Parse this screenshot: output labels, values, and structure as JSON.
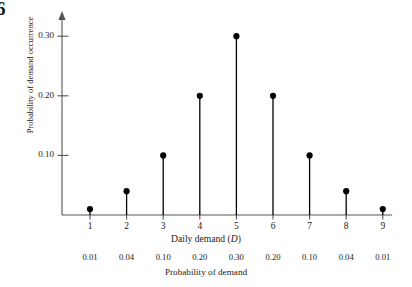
{
  "figure": {
    "number_fragment": "6",
    "y_axis_title": "Probability of demand occurrence",
    "x_axis_title_plain": "Daily demand (",
    "x_axis_title_italic": "D",
    "x_axis_title_close": ")",
    "probability_row_title": "Probability of demand"
  },
  "chart_data": {
    "type": "bar",
    "title": "",
    "xlabel": "Daily demand (D)",
    "ylabel": "Probability of demand occurrence",
    "categories": [
      "1",
      "2",
      "3",
      "4",
      "5",
      "6",
      "7",
      "8",
      "9"
    ],
    "values": [
      0.01,
      0.04,
      0.1,
      0.2,
      0.3,
      0.2,
      0.1,
      0.04,
      0.01
    ],
    "value_labels": [
      "0.01",
      "0.04",
      "0.10",
      "0.20",
      "0.30",
      "0.20",
      "0.10",
      "0.04",
      "0.01"
    ],
    "ylim": [
      0,
      0.335
    ],
    "xlim": [
      0.4,
      9.6
    ],
    "ytick_values": [
      0.1,
      0.2,
      0.3
    ],
    "ytick_labels": [
      "0.10",
      "0.20",
      "0.30"
    ],
    "grid": false,
    "legend": null,
    "marker": "filled-circle",
    "stem_style": "vertical-line",
    "colors": {
      "marker": "#000000",
      "stem": "#000000",
      "axis": "#555555",
      "text": "#1a1a1a"
    }
  }
}
